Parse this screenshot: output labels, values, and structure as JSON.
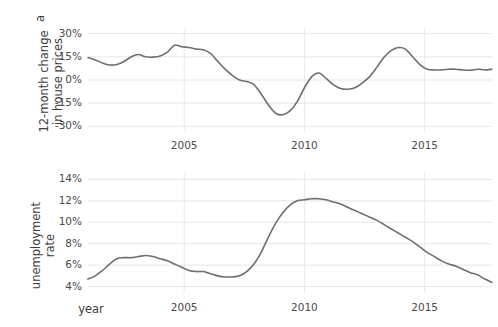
{
  "chart_data": [
    {
      "panel": "a",
      "type": "line",
      "title": "",
      "xlabel": "",
      "ylabel": "12-month change in house prices",
      "xlim": [
        2001.0,
        2017.8
      ],
      "ylim": [
        -33,
        33
      ],
      "yticks": [
        30,
        15,
        0,
        -15,
        -30
      ],
      "ytick_labels": [
        "30%",
        "15%",
        "0%",
        "-15%",
        "-30%"
      ],
      "xticks": [
        2005,
        2010,
        2015
      ],
      "xtick_labels": [
        "2005",
        "2010",
        "2015"
      ],
      "grid": true,
      "legend": "none",
      "line_color": "#6e6e6e",
      "series": [
        {
          "name": "12-month change in house prices",
          "x": [
            2001.0,
            2001.3,
            2001.6,
            2001.9,
            2002.2,
            2002.5,
            2002.8,
            2003.1,
            2003.4,
            2003.7,
            2004.0,
            2004.3,
            2004.6,
            2004.9,
            2005.2,
            2005.5,
            2005.8,
            2006.1,
            2006.4,
            2006.7,
            2007.0,
            2007.3,
            2007.6,
            2007.9,
            2008.2,
            2008.5,
            2008.8,
            2009.1,
            2009.4,
            2009.7,
            2010.0,
            2010.3,
            2010.6,
            2010.9,
            2011.2,
            2011.5,
            2011.8,
            2012.1,
            2012.4,
            2012.7,
            2013.0,
            2013.3,
            2013.6,
            2013.9,
            2014.2,
            2014.5,
            2014.8,
            2015.1,
            2015.4,
            2015.7,
            2016.0,
            2016.3,
            2016.6,
            2016.9,
            2017.2,
            2017.5,
            2017.8
          ],
          "y": [
            14.5,
            13.0,
            11.0,
            9.7,
            10.0,
            12.0,
            15.0,
            16.5,
            15.0,
            14.8,
            15.5,
            18.0,
            22.5,
            21.5,
            21.0,
            20.0,
            19.5,
            17.0,
            12.0,
            7.0,
            3.0,
            0.0,
            -1.0,
            -3.0,
            -9.0,
            -16.0,
            -21.5,
            -22.5,
            -20.0,
            -14.0,
            -5.0,
            2.0,
            4.5,
            1.0,
            -3.0,
            -5.5,
            -6.0,
            -5.0,
            -2.0,
            2.0,
            8.0,
            14.5,
            19.0,
            21.0,
            20.0,
            15.0,
            10.0,
            7.0,
            6.5,
            6.5,
            7.0,
            7.0,
            6.5,
            6.3,
            7.0,
            6.5,
            7.0
          ]
        }
      ]
    },
    {
      "panel": "b",
      "type": "line",
      "title": "",
      "xlabel": "year",
      "ylabel": "unemployment rate",
      "xlim": [
        2001.0,
        2017.8
      ],
      "ylim": [
        3.4,
        14.6
      ],
      "yticks": [
        14,
        12,
        10,
        8,
        6,
        4
      ],
      "ytick_labels": [
        "14%",
        "12%",
        "10%",
        "8%",
        "6%",
        "4%"
      ],
      "xticks": [
        2005,
        2010,
        2015
      ],
      "xtick_labels": [
        "2005",
        "2010",
        "2015"
      ],
      "grid": true,
      "legend": "none",
      "line_color": "#6e6e6e",
      "series": [
        {
          "name": "unemployment rate",
          "x": [
            2001.0,
            2001.3,
            2001.6,
            2001.9,
            2002.2,
            2002.5,
            2002.8,
            2003.1,
            2003.4,
            2003.7,
            2004.0,
            2004.3,
            2004.6,
            2004.9,
            2005.2,
            2005.5,
            2005.8,
            2006.1,
            2006.4,
            2006.7,
            2007.0,
            2007.3,
            2007.6,
            2007.9,
            2008.2,
            2008.5,
            2008.8,
            2009.1,
            2009.4,
            2009.7,
            2010.0,
            2010.3,
            2010.6,
            2010.9,
            2011.2,
            2011.5,
            2011.8,
            2012.1,
            2012.4,
            2012.7,
            2013.0,
            2013.3,
            2013.6,
            2013.9,
            2014.2,
            2014.5,
            2014.8,
            2015.1,
            2015.4,
            2015.7,
            2016.0,
            2016.3,
            2016.6,
            2016.9,
            2017.2,
            2017.5,
            2017.8
          ],
          "y": [
            4.7,
            5.0,
            5.5,
            6.1,
            6.6,
            6.7,
            6.7,
            6.8,
            6.9,
            6.8,
            6.6,
            6.4,
            6.1,
            5.8,
            5.5,
            5.4,
            5.4,
            5.2,
            5.0,
            4.9,
            4.9,
            5.0,
            5.4,
            6.1,
            7.2,
            8.6,
            9.9,
            10.9,
            11.6,
            12.0,
            12.1,
            12.2,
            12.2,
            12.1,
            11.9,
            11.7,
            11.4,
            11.1,
            10.8,
            10.5,
            10.2,
            9.8,
            9.4,
            9.0,
            8.6,
            8.2,
            7.7,
            7.2,
            6.8,
            6.4,
            6.1,
            5.9,
            5.6,
            5.3,
            5.1,
            4.7,
            4.4
          ]
        }
      ]
    }
  ],
  "panels": {
    "a": {
      "tag": "a",
      "axis_title_line1": "12-month change",
      "axis_title_line2": "in house prices"
    },
    "b": {
      "tag": "b",
      "axis_title_line1": "unemployment",
      "axis_title_line2": "rate"
    }
  },
  "axes": {
    "x_title": "year"
  }
}
